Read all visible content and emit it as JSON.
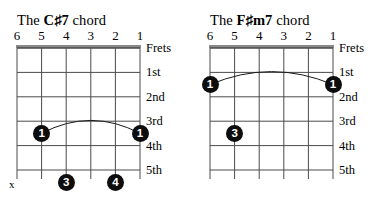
{
  "page": {
    "background_color": "#ffffff",
    "ink_color": "#000000",
    "dot_color": "#0d0d0d",
    "dot_text_color": "#ffffff",
    "grid_line_color": "#4a4a4a",
    "nut_color": "#8a8a8a"
  },
  "chart_data": {
    "type": "table",
    "diagrams": [
      {
        "title_prefix": "The ",
        "chord_name": "C♯7",
        "title_suffix": " chord",
        "string_numbers": [
          "6",
          "5",
          "4",
          "3",
          "2",
          "1"
        ],
        "fret_labels": [
          "Frets",
          "1st",
          "2nd",
          "3rd",
          "4th",
          "5th"
        ],
        "mute_marker": "x",
        "mute_marker_string": 6,
        "barre": {
          "finger": "1",
          "from_string": 5,
          "to_string": 1,
          "fret": 4
        },
        "fingerings": [
          {
            "finger": "1",
            "string": 5,
            "fret": 4
          },
          {
            "finger": "1",
            "string": 1,
            "fret": 4
          },
          {
            "finger": "3",
            "string": 4,
            "fret": 6
          },
          {
            "finger": "4",
            "string": 2,
            "fret": 6
          }
        ]
      },
      {
        "title_prefix": "The ",
        "chord_name": "F♯m7",
        "title_suffix": " chord",
        "string_numbers": [
          "6",
          "5",
          "4",
          "3",
          "2",
          "1"
        ],
        "fret_labels": [
          "Frets",
          "1st",
          "2nd",
          "3rd",
          "4th",
          "5th"
        ],
        "mute_marker": "",
        "mute_marker_string": 0,
        "barre": {
          "finger": "1",
          "from_string": 6,
          "to_string": 1,
          "fret": 2
        },
        "fingerings": [
          {
            "finger": "1",
            "string": 6,
            "fret": 2
          },
          {
            "finger": "1",
            "string": 1,
            "fret": 2
          },
          {
            "finger": "3",
            "string": 5,
            "fret": 4
          }
        ]
      }
    ]
  }
}
